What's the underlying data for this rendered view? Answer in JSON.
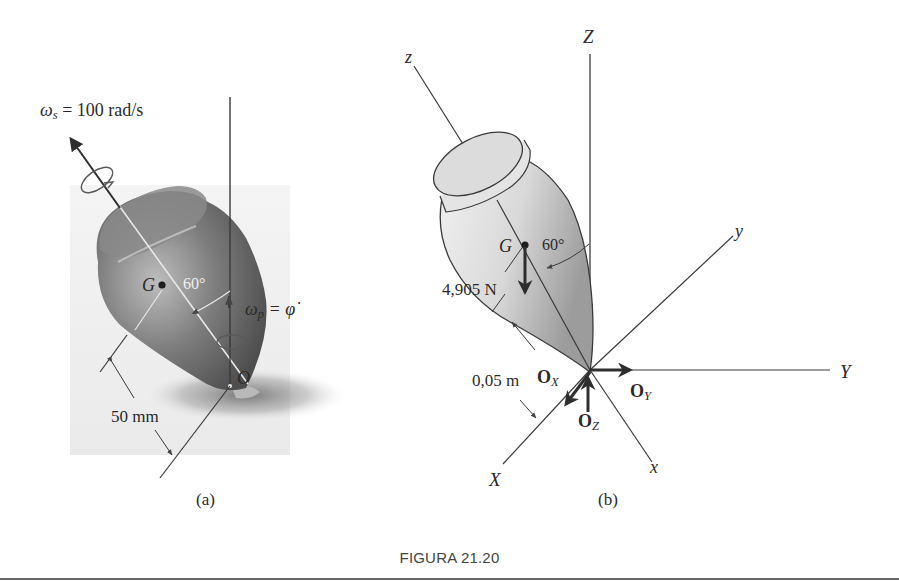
{
  "figure": {
    "caption": "FIGURA 21.20",
    "panel_a": {
      "label": "(a)",
      "spin_symbol": "ω",
      "spin_sub": "s",
      "spin_value": "= 100 rad/s",
      "precession_symbol": "ω",
      "precession_sub": "p",
      "precession_eq": "= φ̇",
      "center_of_mass": "G",
      "pivot": "O",
      "angle": "60°",
      "distance": "50 mm"
    },
    "panel_b": {
      "label": "(b)",
      "axis_Z": "Z",
      "axis_z": "z",
      "axis_Y": "Y",
      "axis_y": "y",
      "axis_X": "X",
      "axis_x": "x",
      "center_of_mass": "G",
      "angle": "60°",
      "weight": "4,905 N",
      "distance": "0,05 m",
      "reaction_x": "O",
      "reaction_x_sub": "X",
      "reaction_y": "O",
      "reaction_y_sub": "Y",
      "reaction_z": "O",
      "reaction_z_sub": "Z"
    },
    "colors": {
      "line": "#3a3a3a",
      "top_dark": "#6e6e6e",
      "top_light": "#bdbdbd",
      "shadow": "#8a8a8a"
    }
  }
}
